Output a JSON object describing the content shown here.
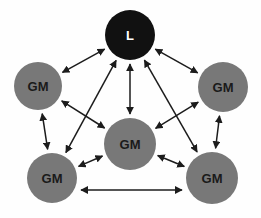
{
  "diagram": {
    "background_color": "#fefefe",
    "edge_color": "#1c1c1c",
    "nodes": [
      {
        "id": "leader",
        "label": "L",
        "role": "leader",
        "fill": "#111111",
        "text_color": "#ffffff",
        "cx": 130,
        "cy": 35,
        "r": 25
      },
      {
        "id": "gm-upper-left",
        "label": "GM",
        "role": "group-member",
        "fill": "#787878",
        "text_color": "#1a1a1a",
        "cx": 38,
        "cy": 86,
        "r": 24
      },
      {
        "id": "gm-upper-right",
        "label": "GM",
        "role": "group-member",
        "fill": "#787878",
        "text_color": "#1a1a1a",
        "cx": 223,
        "cy": 87,
        "r": 25
      },
      {
        "id": "gm-center",
        "label": "GM",
        "role": "group-member",
        "fill": "#787878",
        "text_color": "#1a1a1a",
        "cx": 130,
        "cy": 144,
        "r": 26
      },
      {
        "id": "gm-lower-left",
        "label": "GM",
        "role": "group-member",
        "fill": "#787878",
        "text_color": "#1a1a1a",
        "cx": 52,
        "cy": 178,
        "r": 25
      },
      {
        "id": "gm-lower-right",
        "label": "GM",
        "role": "group-member",
        "fill": "#787878",
        "text_color": "#1a1a1a",
        "cx": 212,
        "cy": 178,
        "r": 26
      }
    ],
    "edges": [
      {
        "id": "edge-leader-gm-upper-left",
        "from": "leader",
        "to": "gm-upper-left",
        "arrows": "both"
      },
      {
        "id": "edge-leader-gm-upper-right",
        "from": "leader",
        "to": "gm-upper-right",
        "arrows": "both"
      },
      {
        "id": "edge-leader-gm-center",
        "from": "leader",
        "to": "gm-center",
        "arrows": "both"
      },
      {
        "id": "edge-leader-gm-lower-left",
        "from": "leader",
        "to": "gm-lower-left",
        "arrows": "both"
      },
      {
        "id": "edge-leader-gm-lower-right",
        "from": "leader",
        "to": "gm-lower-right",
        "arrows": "both"
      },
      {
        "id": "edge-gm-upper-left-gm-lower-left",
        "from": "gm-upper-left",
        "to": "gm-lower-left",
        "arrows": "both"
      },
      {
        "id": "edge-gm-upper-right-gm-lower-right",
        "from": "gm-upper-right",
        "to": "gm-lower-right",
        "arrows": "both"
      },
      {
        "id": "edge-gm-upper-left-gm-center",
        "from": "gm-upper-left",
        "to": "gm-center",
        "arrows": "both"
      },
      {
        "id": "edge-gm-upper-right-gm-center",
        "from": "gm-upper-right",
        "to": "gm-center",
        "arrows": "both"
      },
      {
        "id": "edge-gm-lower-left-gm-center",
        "from": "gm-lower-left",
        "to": "gm-center",
        "arrows": "both"
      },
      {
        "id": "edge-gm-lower-right-gm-center",
        "from": "gm-lower-right",
        "to": "gm-center",
        "arrows": "both"
      },
      {
        "id": "edge-gm-lower-left-gm-lower-right",
        "from": "gm-lower-left",
        "to": "gm-lower-right",
        "arrows": "both",
        "offset": 12
      }
    ]
  }
}
